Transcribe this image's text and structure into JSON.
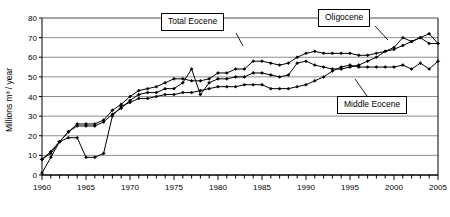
{
  "chart_data": {
    "type": "line",
    "title": "",
    "xlabel": "",
    "ylabel": "Millions m³ / year",
    "xlim": [
      1960,
      2005
    ],
    "ylim": [
      0,
      80
    ],
    "ytick_step": 10,
    "yticks": [
      0,
      10,
      20,
      30,
      40,
      50,
      60,
      70,
      80
    ],
    "xticks_major": [
      1960,
      1965,
      1970,
      1975,
      1980,
      1985,
      1990,
      1995,
      2000,
      2005
    ],
    "xtick_minor_step": 1,
    "grid": "horizontal",
    "legend_position": "callout-labels",
    "marker": "filled-diamond",
    "line_color": "#000000",
    "x": [
      1960,
      1961,
      1962,
      1963,
      1964,
      1965,
      1966,
      1967,
      1968,
      1969,
      1970,
      1971,
      1972,
      1973,
      1974,
      1975,
      1976,
      1977,
      1978,
      1979,
      1980,
      1981,
      1982,
      1983,
      1984,
      1985,
      1986,
      1987,
      1988,
      1989,
      1990,
      1991,
      1992,
      1993,
      1994,
      1995,
      1996,
      1997,
      1998,
      1999,
      2000,
      2001,
      2002,
      2003,
      2004,
      2005
    ],
    "series": [
      {
        "name": "Total Eocene",
        "values": [
          8,
          11,
          17,
          22,
          26,
          26,
          26,
          28,
          33,
          36,
          40,
          43,
          44,
          45,
          47,
          49,
          49,
          48,
          48,
          49,
          52,
          52,
          54,
          54,
          58,
          58,
          57,
          56,
          57,
          60,
          62,
          63,
          62,
          62,
          62,
          62,
          61,
          61,
          62,
          63,
          64,
          66,
          68,
          70,
          67,
          67
        ]
      },
      {
        "name": "Oligocene",
        "values": [
          8,
          12,
          17,
          22,
          25,
          25,
          25,
          27,
          31,
          34,
          38,
          41,
          42,
          42,
          44,
          44,
          47,
          54,
          41,
          47,
          49,
          49,
          50,
          50,
          52,
          52,
          51,
          50,
          51,
          57,
          58,
          56,
          55,
          54,
          54,
          55,
          56,
          58,
          60,
          63,
          65,
          70,
          68,
          70,
          72,
          67
        ]
      },
      {
        "name": "Middle Eocene",
        "values": [
          1,
          9,
          17,
          19,
          19,
          9,
          9,
          11,
          30,
          35,
          37,
          39,
          39,
          40,
          41,
          41,
          42,
          42,
          43,
          44,
          45,
          45,
          45,
          46,
          46,
          46,
          44,
          44,
          44,
          45,
          46,
          48,
          50,
          53,
          55,
          56,
          55,
          55,
          55,
          55,
          55,
          56,
          54,
          57,
          54,
          58
        ]
      }
    ]
  },
  "callouts": [
    {
      "id": "total-eocene",
      "label": "Total Eocene"
    },
    {
      "id": "oligocene",
      "label": "Oligocene"
    },
    {
      "id": "middle-eocene",
      "label": "Middle Eocene"
    }
  ]
}
